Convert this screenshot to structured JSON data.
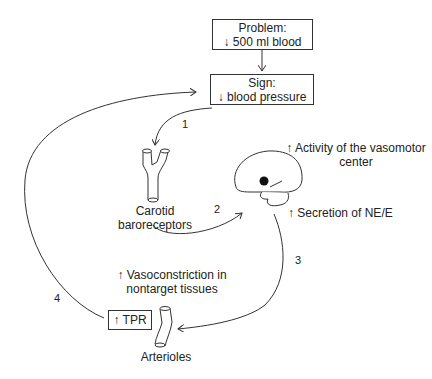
{
  "diagram": {
    "problem_box": {
      "line1": "Problem:",
      "line2": "↓ 500 ml blood"
    },
    "sign_box": {
      "line1": "Sign:",
      "line2": "↓ blood pressure"
    },
    "carotid": {
      "line1": "Carotid",
      "line2": "baroreceptors"
    },
    "vasomotor": {
      "line1": "↑ Activity of the vasomotor",
      "line2": "center"
    },
    "secretion": "↑ Secretion of NE/E",
    "vasoconstriction": {
      "line1": "↑ Vasoconstriction in",
      "line2": "nontarget tissues"
    },
    "tpr_box": "↑ TPR",
    "arterioles": "Arterioles",
    "steps": [
      "1",
      "2",
      "3",
      "4"
    ],
    "colors": {
      "line": "#333333",
      "background": "#ffffff"
    }
  }
}
